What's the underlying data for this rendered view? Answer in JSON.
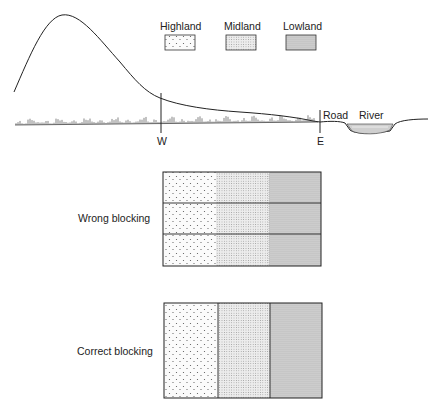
{
  "legend": {
    "items": [
      {
        "label": "Highland",
        "pattern": "sparse-dots"
      },
      {
        "label": "Midland",
        "pattern": "fine-stipple"
      },
      {
        "label": "Lowland",
        "pattern": "dense-stipple"
      }
    ]
  },
  "profile": {
    "markers": {
      "west": "W",
      "east": "E"
    },
    "labels": {
      "road": "Road",
      "river": "River"
    }
  },
  "blocks": {
    "wrong": {
      "label": "Wrong blocking",
      "rows": 3,
      "columns": [
        "Highland",
        "Midland",
        "Lowland"
      ]
    },
    "correct": {
      "label": "Correct blocking",
      "rows": 1,
      "columns": [
        "Highland",
        "Midland",
        "Lowland"
      ]
    }
  }
}
